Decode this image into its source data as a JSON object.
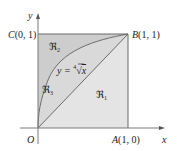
{
  "figure": {
    "type": "region-diagram",
    "colors": {
      "region_fill_dark": "#cfcfcf",
      "region_fill_light": "#e2e2e2",
      "line": "#6b6b6b",
      "axis": "#7a7a7a"
    },
    "axes": {
      "x_label": "x",
      "y_label": "y"
    },
    "points": {
      "origin": {
        "name": "O",
        "coords": ""
      },
      "A": {
        "name": "A",
        "coords": "(1, 0)"
      },
      "B": {
        "name": "B",
        "coords": "(1, 1)"
      },
      "C": {
        "name": "C",
        "coords": "(0, 1)"
      }
    },
    "curve": {
      "lhs": "y = ",
      "index": "4",
      "radicand": "x"
    },
    "regions": [
      {
        "id": "R1",
        "label": "ℜ",
        "sub": "1"
      },
      {
        "id": "R2",
        "label": "ℜ",
        "sub": "2"
      },
      {
        "id": "R3",
        "label": "ℜ",
        "sub": "3"
      }
    ]
  }
}
